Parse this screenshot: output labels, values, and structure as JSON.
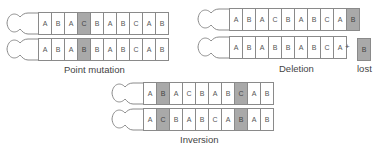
{
  "panels": {
    "point_mutation": {
      "label": "Point mutation",
      "before": [
        "A",
        "B",
        "A",
        "C",
        "B",
        "A",
        "B",
        "C",
        "A",
        "B"
      ],
      "after": [
        "A",
        "B",
        "A",
        "B",
        "B",
        "A",
        "B",
        "C",
        "A",
        "B"
      ],
      "highlight_before": [
        3
      ],
      "highlight_after": [
        3
      ]
    },
    "deletion": {
      "label": "Deletion",
      "before": [
        "A",
        "B",
        "A",
        "C",
        "B",
        "A",
        "B",
        "C",
        "A",
        "B"
      ],
      "after": [
        "A",
        "B",
        "A",
        "B",
        "B",
        "A",
        "B",
        "C",
        "A"
      ],
      "plus": "+",
      "lost_gene": "B",
      "lost_label": "lost"
    },
    "inversion": {
      "label": "Inversion",
      "before": [
        "A",
        "B",
        "A",
        "C",
        "B",
        "A",
        "B",
        "C",
        "A",
        "B"
      ],
      "after": [
        "A",
        "C",
        "B",
        "A",
        "B",
        "C",
        "A",
        "B",
        "A",
        "B"
      ]
    }
  },
  "colors": {
    "highlight": "#a9a9a9",
    "outline": "#8a8a8a"
  }
}
